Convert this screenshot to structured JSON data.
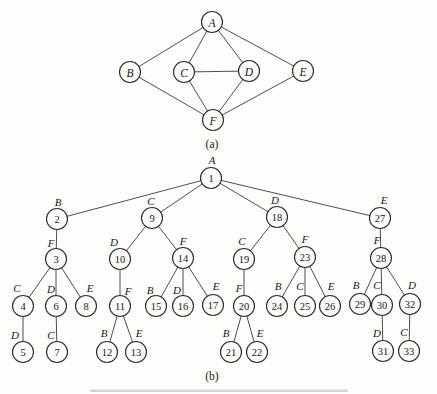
{
  "figure": {
    "background": "#fdfdfb",
    "line_color": "#3a3a3c",
    "node_fill": "#fdfdfb",
    "node_stroke": "#2e2e30",
    "text_color": "#17171a",
    "node_radius": 10.5
  },
  "graph_a": {
    "caption": "(a)",
    "caption_x": 212,
    "caption_y": 144,
    "nodes": [
      {
        "id": "A",
        "x": 212,
        "y": 22
      },
      {
        "id": "B",
        "x": 130,
        "y": 72
      },
      {
        "id": "C",
        "x": 184,
        "y": 72
      },
      {
        "id": "D",
        "x": 249,
        "y": 71
      },
      {
        "id": "E",
        "x": 303,
        "y": 71
      },
      {
        "id": "F",
        "x": 213,
        "y": 120
      }
    ],
    "edges": [
      [
        "A",
        "B"
      ],
      [
        "A",
        "C"
      ],
      [
        "A",
        "D"
      ],
      [
        "A",
        "E"
      ],
      [
        "C",
        "D"
      ],
      [
        "B",
        "F"
      ],
      [
        "C",
        "F"
      ],
      [
        "D",
        "F"
      ],
      [
        "E",
        "F"
      ]
    ]
  },
  "tree_b": {
    "caption": "(b)",
    "caption_x": 212,
    "caption_y": 376,
    "nodes": [
      {
        "num": 1,
        "letter": "A",
        "x": 211,
        "y": 178,
        "parent": null,
        "lx": 212,
        "ly": 160
      },
      {
        "num": 2,
        "letter": "B",
        "x": 57,
        "y": 219,
        "parent": 1,
        "lx": 58,
        "ly": 202
      },
      {
        "num": 9,
        "letter": "C",
        "x": 152,
        "y": 218,
        "parent": 1,
        "lx": 151,
        "ly": 201
      },
      {
        "num": 18,
        "letter": "D",
        "x": 277,
        "y": 217,
        "parent": 1,
        "lx": 275,
        "ly": 200
      },
      {
        "num": 27,
        "letter": "E",
        "x": 380,
        "y": 218,
        "parent": 1,
        "lx": 384,
        "ly": 200
      },
      {
        "num": 3,
        "letter": "F",
        "x": 56,
        "y": 259,
        "parent": 2,
        "lx": 51,
        "ly": 243
      },
      {
        "num": 10,
        "letter": "D",
        "x": 120,
        "y": 259,
        "parent": 9,
        "lx": 114,
        "ly": 242
      },
      {
        "num": 14,
        "letter": "F",
        "x": 183,
        "y": 258,
        "parent": 9,
        "lx": 183,
        "ly": 241
      },
      {
        "num": 19,
        "letter": "C",
        "x": 244,
        "y": 259,
        "parent": 18,
        "lx": 242,
        "ly": 241
      },
      {
        "num": 23,
        "letter": "F",
        "x": 305,
        "y": 257,
        "parent": 18,
        "lx": 305,
        "ly": 239
      },
      {
        "num": 28,
        "letter": "F",
        "x": 381,
        "y": 258,
        "parent": 27,
        "lx": 377,
        "ly": 240
      },
      {
        "num": 4,
        "letter": "C",
        "x": 23,
        "y": 306,
        "parent": 3,
        "lx": 17,
        "ly": 288
      },
      {
        "num": 6,
        "letter": "D",
        "x": 56,
        "y": 306,
        "parent": 3,
        "lx": 51,
        "ly": 289
      },
      {
        "num": 8,
        "letter": "E",
        "x": 86,
        "y": 306,
        "parent": 3,
        "lx": 90,
        "ly": 288
      },
      {
        "num": 11,
        "letter": "F",
        "x": 120,
        "y": 306,
        "parent": 10,
        "lx": 128,
        "ly": 291
      },
      {
        "num": 15,
        "letter": "B",
        "x": 156,
        "y": 306,
        "parent": 14,
        "lx": 150,
        "ly": 290
      },
      {
        "num": 16,
        "letter": "D",
        "x": 183,
        "y": 306,
        "parent": 14,
        "lx": 177,
        "ly": 290
      },
      {
        "num": 17,
        "letter": "E",
        "x": 213,
        "y": 305,
        "parent": 14,
        "lx": 216,
        "ly": 286
      },
      {
        "num": 20,
        "letter": "F",
        "x": 244,
        "y": 306,
        "parent": 19,
        "lx": 239,
        "ly": 288
      },
      {
        "num": 24,
        "letter": "B",
        "x": 277,
        "y": 306,
        "parent": 23,
        "lx": 278,
        "ly": 286
      },
      {
        "num": 25,
        "letter": "C",
        "x": 305,
        "y": 306,
        "parent": 23,
        "lx": 300,
        "ly": 286
      },
      {
        "num": 26,
        "letter": "E",
        "x": 330,
        "y": 306,
        "parent": 23,
        "lx": 331,
        "ly": 286
      },
      {
        "num": 29,
        "letter": "B",
        "x": 360,
        "y": 304,
        "parent": 28,
        "lx": 356,
        "ly": 285
      },
      {
        "num": 30,
        "letter": "C",
        "x": 382,
        "y": 305,
        "parent": 28,
        "lx": 377,
        "ly": 285
      },
      {
        "num": 32,
        "letter": "D",
        "x": 410,
        "y": 304,
        "parent": 28,
        "lx": 412,
        "ly": 285
      },
      {
        "num": 5,
        "letter": "D",
        "x": 23,
        "y": 352,
        "parent": 4,
        "lx": 15,
        "ly": 335
      },
      {
        "num": 7,
        "letter": "C",
        "x": 57,
        "y": 352,
        "parent": 6,
        "lx": 51,
        "ly": 335
      },
      {
        "num": 12,
        "letter": "B",
        "x": 107,
        "y": 352,
        "parent": 11,
        "lx": 104,
        "ly": 333
      },
      {
        "num": 13,
        "letter": "E",
        "x": 136,
        "y": 352,
        "parent": 11,
        "lx": 139,
        "ly": 333
      },
      {
        "num": 21,
        "letter": "B",
        "x": 231,
        "y": 352,
        "parent": 20,
        "lx": 226,
        "ly": 333
      },
      {
        "num": 22,
        "letter": "E",
        "x": 257,
        "y": 352,
        "parent": 20,
        "lx": 260,
        "ly": 333
      },
      {
        "num": 31,
        "letter": "D",
        "x": 383,
        "y": 351,
        "parent": 30,
        "lx": 377,
        "ly": 333
      },
      {
        "num": 33,
        "letter": "C",
        "x": 409,
        "y": 351,
        "parent": 32,
        "lx": 404,
        "ly": 332
      }
    ]
  },
  "scan_artifact": {
    "x": 90,
    "y": 389.5,
    "width": 258,
    "height": 2.6,
    "color": "#b9b9b5",
    "opacity": 0.6
  }
}
